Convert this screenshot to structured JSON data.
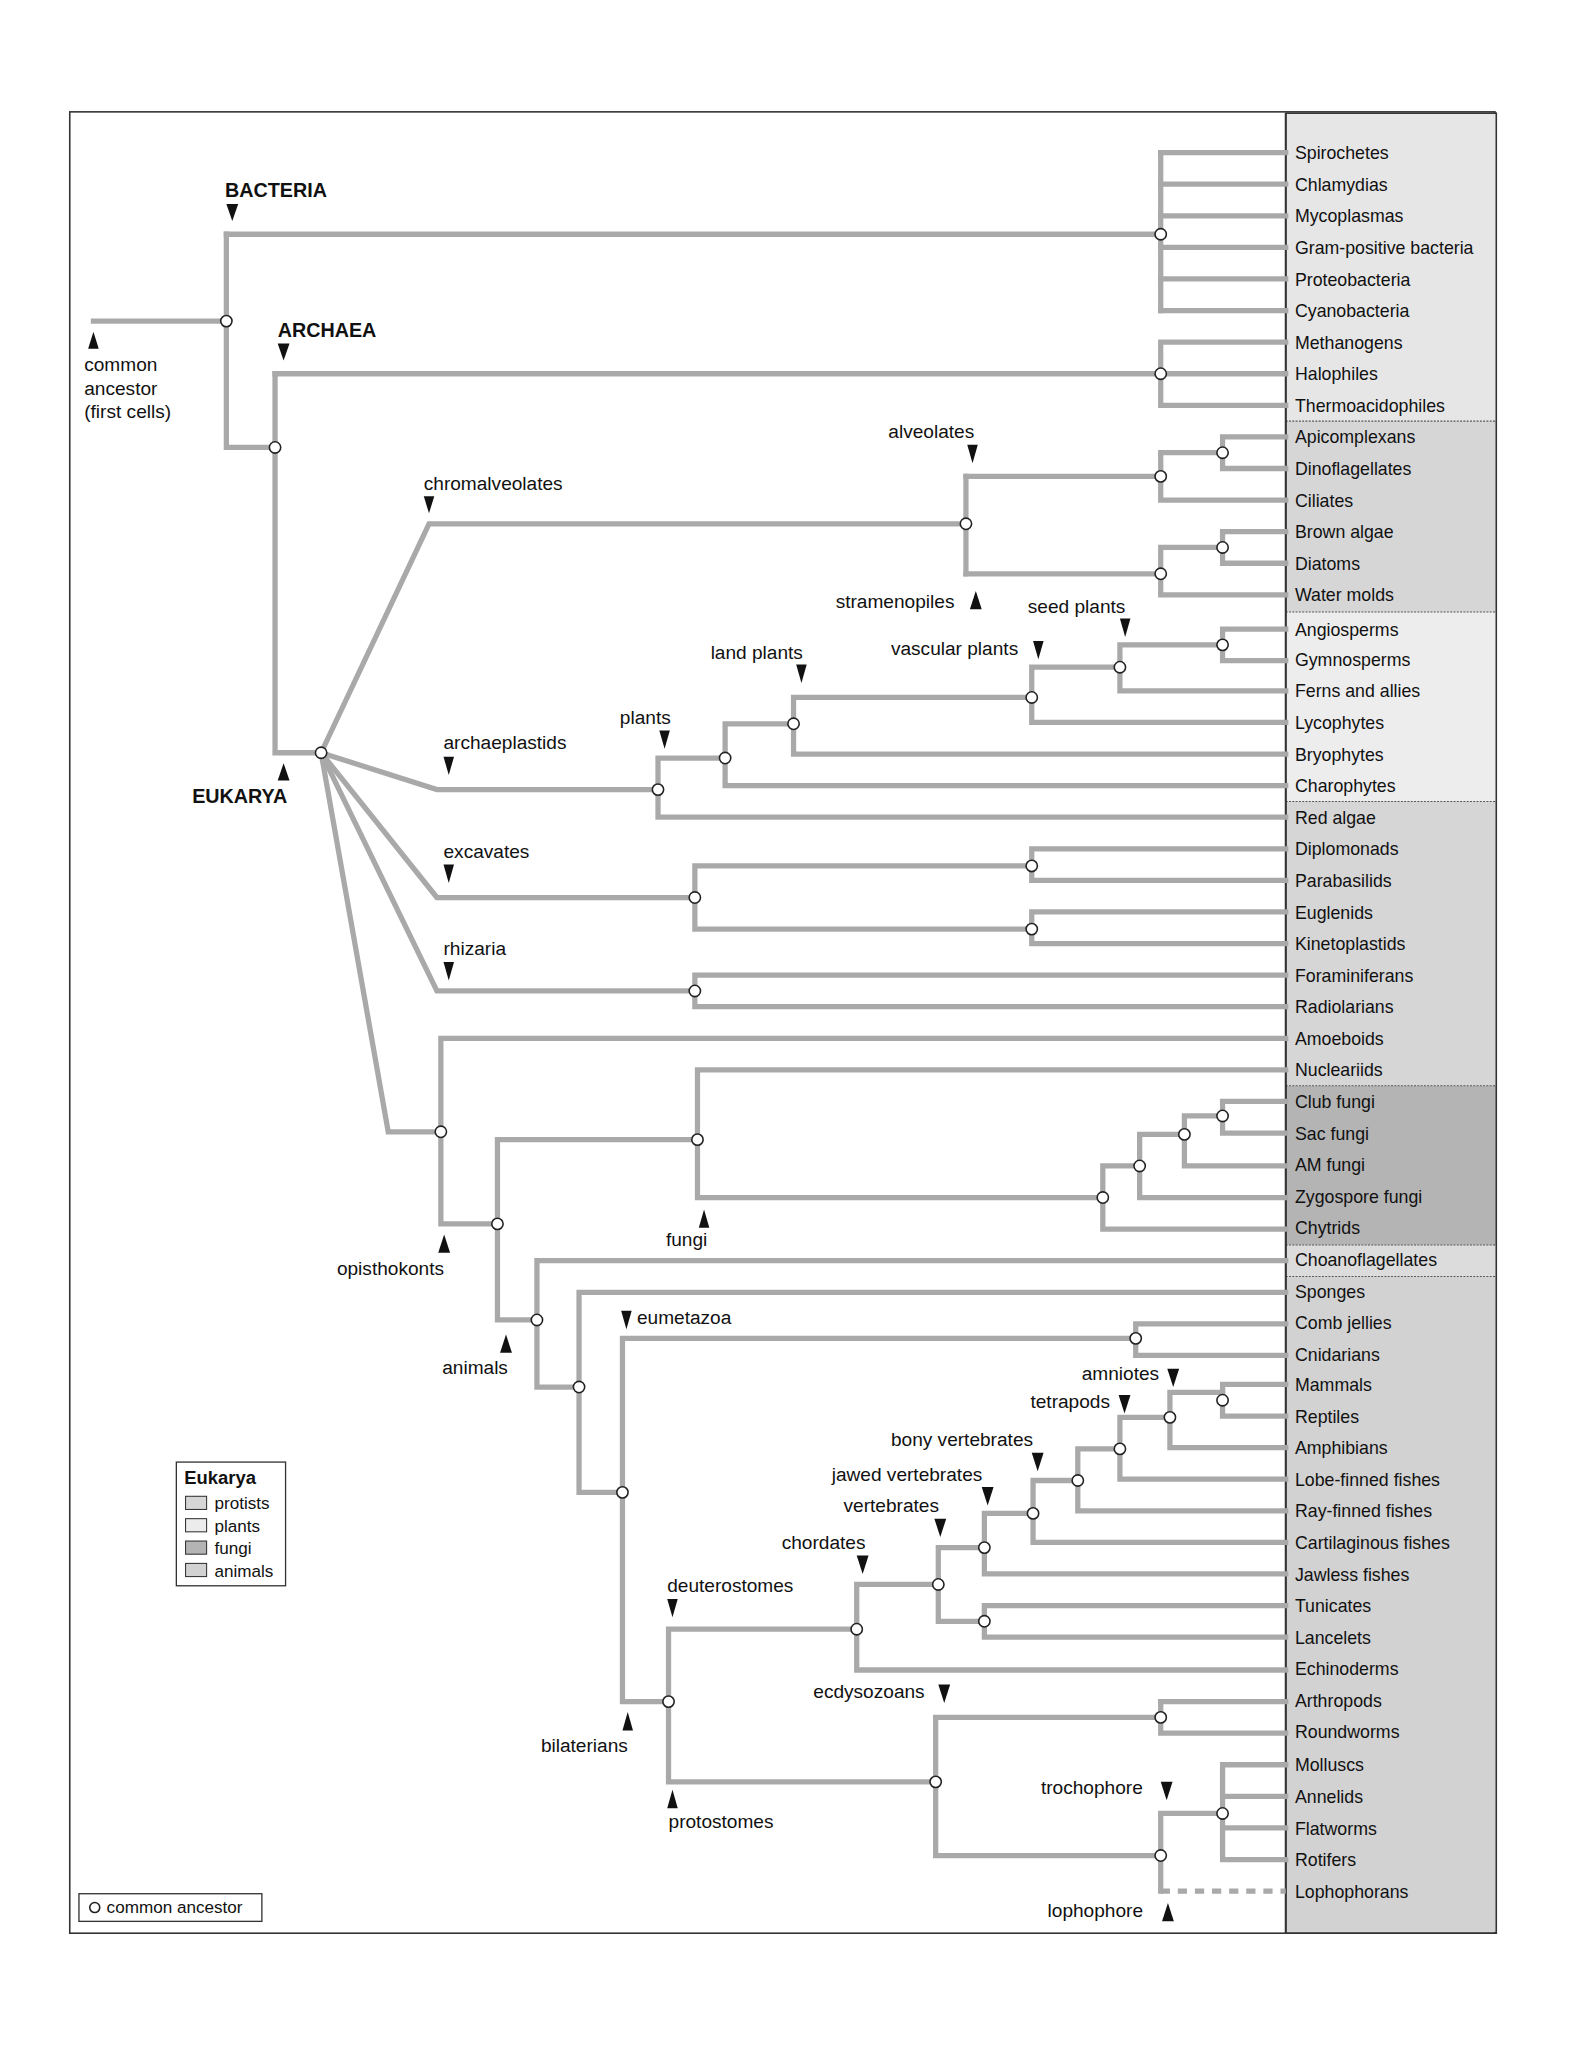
{
  "labels": {
    "bacteria": "BACTERIA",
    "archaea": "ARCHAEA",
    "eukarya": "EUKARYA",
    "common_ancestor_line1": "common",
    "common_ancestor_line2": "ancestor",
    "common_ancestor_line3": "(first cells)",
    "chromalveolates": "chromalveolates",
    "alveolates": "alveolates",
    "stramenopiles": "stramenopiles",
    "archaeplastids": "archaeplastids",
    "plants": "plants",
    "land_plants": "land plants",
    "vascular_plants": "vascular plants",
    "seed_plants": "seed plants",
    "excavates": "excavates",
    "rhizaria": "rhizaria",
    "opisthokonts": "opisthokonts",
    "fungi": "fungi",
    "animals": "animals",
    "eumetazoa": "eumetazoa",
    "bilaterians": "bilaterians",
    "deuterostomes": "deuterostomes",
    "protostomes": "protostomes",
    "chordates": "chordates",
    "vertebrates": "vertebrates",
    "jawed_vertebrates": "jawed vertebrates",
    "bony_vertebrates": "bony vertebrates",
    "tetrapods": "tetrapods",
    "amniotes": "amniotes",
    "ecdysozoans": "ecdysozoans",
    "trochophore": "trochophore",
    "lophophore": "lophophore"
  },
  "legend": {
    "title": "Eukarya",
    "items": [
      {
        "label": "protists",
        "color": "#d6d6d6"
      },
      {
        "label": "plants",
        "color": "#ececec"
      },
      {
        "label": "fungi",
        "color": "#b4b4b4"
      },
      {
        "label": "animals",
        "color": "#d2d2d2"
      }
    ],
    "node_key": "common ancestor"
  },
  "taxa": [
    "Spirochetes",
    "Chlamydias",
    "Mycoplasmas",
    "Gram-positive bacteria",
    "Proteobacteria",
    "Cyanobacteria",
    "Methanogens",
    "Halophiles",
    "Thermoacidophiles",
    "Apicomplexans",
    "Dinoflagellates",
    "Ciliates",
    "Brown algae",
    "Diatoms",
    "Water molds",
    "Angiosperms",
    "Gymnosperms",
    "Ferns and allies",
    "Lycophytes",
    "Bryophytes",
    "Charophytes",
    "Red algae",
    "Diplomonads",
    "Parabasilids",
    "Euglenids",
    "Kinetoplastids",
    "Foraminiferans",
    "Radiolarians",
    "Amoeboids",
    "Nucleariids",
    "Club fungi",
    "Sac fungi",
    "AM fungi",
    "Zygospore fungi",
    "Chytrids",
    "Choanoflagellates",
    "Sponges",
    "Comb jellies",
    "Cnidarians",
    "Mammals",
    "Reptiles",
    "Amphibians",
    "Lobe-finned fishes",
    "Ray-finned fishes",
    "Cartilaginous fishes",
    "Jawless fishes",
    "Tunicates",
    "Lancelets",
    "Echinoderms",
    "Arthropods",
    "Roundworms",
    "Molluscs",
    "Annelids",
    "Flatworms",
    "Rotifers",
    "Lophophorans"
  ],
  "panel_groups": [
    {
      "name": "bacteria-archaea",
      "from": 0,
      "to": 8,
      "color": "#e6e6e6"
    },
    {
      "name": "protists-a",
      "from": 9,
      "to": 14,
      "color": "#d6d6d6"
    },
    {
      "name": "plants",
      "from": 15,
      "to": 20,
      "color": "#ececec"
    },
    {
      "name": "protists-b",
      "from": 21,
      "to": 29,
      "color": "#d6d6d6"
    },
    {
      "name": "fungi",
      "from": 30,
      "to": 34,
      "color": "#b4b4b4"
    },
    {
      "name": "protists-c",
      "from": 35,
      "to": 35,
      "color": "#dcdcdc"
    },
    {
      "name": "animals",
      "from": 36,
      "to": 55,
      "color": "#d2d2d2"
    }
  ]
}
